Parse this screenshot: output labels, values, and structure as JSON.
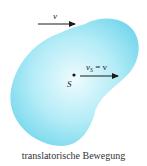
{
  "figure": {
    "body_color": "#7fdcef",
    "body_highlight": "#e6f8fc",
    "arrow_color": "#1a1a1a",
    "top_arrow": {
      "label": "v"
    },
    "center_point": {
      "label": "S"
    },
    "center_arrow": {
      "label_main": "v",
      "label_sub": "S",
      "label_rest": " = v"
    }
  },
  "caption": "translatorische Bewegung"
}
